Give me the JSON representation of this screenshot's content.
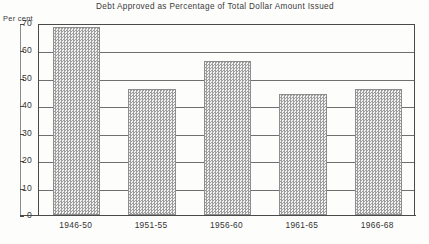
{
  "chart_data": {
    "type": "bar",
    "title": "Debt Approved as Percentage of Total Dollar Amount Issued",
    "xlabel": "",
    "ylabel": "Per cent",
    "categories": [
      "1946-50",
      "1951-55",
      "1956-60",
      "1961-65",
      "1966-68"
    ],
    "values": [
      68.5,
      46.0,
      56.0,
      44.0,
      46.0
    ],
    "ylim": [
      0,
      70
    ],
    "yticks": [
      0,
      10,
      20,
      30,
      40,
      50,
      60,
      70
    ],
    "ytick_labels": [
      "0",
      "10",
      "20",
      "30",
      "40",
      "50",
      "60",
      "70"
    ],
    "grid": true,
    "legend": "none",
    "series": [
      {
        "name": "Debt approved as percentage of total dollar amount issued",
        "values": [
          68.5,
          46.0,
          56.0,
          44.0,
          46.0
        ]
      }
    ],
    "bar_fill": "#e9e9e9",
    "bar_edge": "#8d8d8d",
    "grid_color": "#6f6f6f",
    "text_color": "#333333"
  }
}
